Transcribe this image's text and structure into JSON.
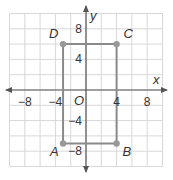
{
  "diagram": {
    "type": "coordinate-plane-rectangle",
    "axes": {
      "x_label": "x",
      "y_label": "y",
      "origin_label": "O",
      "x_range": [
        -10,
        10
      ],
      "y_range": [
        -10,
        10
      ],
      "grid_step": 2,
      "x_ticks": [
        {
          "value": -8,
          "label": "−8"
        },
        {
          "value": -4,
          "label": "−4"
        },
        {
          "value": 4,
          "label": "4"
        },
        {
          "value": 8,
          "label": "8"
        }
      ],
      "y_ticks": [
        {
          "value": 8,
          "label": "8"
        },
        {
          "value": 4,
          "label": "4"
        },
        {
          "value": -4,
          "label": "−4"
        },
        {
          "value": -8,
          "label": "−8"
        }
      ]
    },
    "points": [
      {
        "name": "A",
        "x": -3,
        "y": -7
      },
      {
        "name": "B",
        "x": 4,
        "y": -7
      },
      {
        "name": "C",
        "x": 4,
        "y": 6
      },
      {
        "name": "D",
        "x": -3,
        "y": 6
      }
    ],
    "colors": {
      "grid": "#d8d8d8",
      "axis": "#555555",
      "shape": "#8a8a8a",
      "point": "#999999",
      "text": "#333333"
    }
  }
}
